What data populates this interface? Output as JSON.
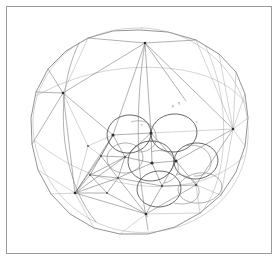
{
  "figure": {
    "caption": "",
    "background_color": "#ffffff",
    "frame": {
      "name": "figure-border",
      "x": 6,
      "y": 6,
      "width": 266,
      "height": 248,
      "stroke_color": "#9a9a9a",
      "stroke_width": 1
    },
    "colors": {
      "frame": "#9a9a9a",
      "sphere_outline": "#6f6f6f",
      "mesh_edge": "#7d7d7d",
      "mesh_edge_faint": "#a8a8a8",
      "circle_stroke": "#4a4a4a",
      "node": "#2e2e2e",
      "annotation": "#707070"
    },
    "sphere": {
      "name": "sphere-outline",
      "center_x": 140,
      "center_y": 130,
      "radius_x": 108,
      "radius_y": 100,
      "outline_points": [
        [
          140,
          30
        ],
        [
          168,
          32
        ],
        [
          196,
          40
        ],
        [
          219,
          54
        ],
        [
          236,
          72
        ],
        [
          245,
          94
        ],
        [
          248,
          118
        ],
        [
          245,
          146
        ],
        [
          236,
          172
        ],
        [
          221,
          195
        ],
        [
          200,
          213
        ],
        [
          175,
          227
        ],
        [
          148,
          234
        ],
        [
          120,
          234
        ],
        [
          94,
          228
        ],
        [
          70,
          214
        ],
        [
          51,
          194
        ],
        [
          38,
          170
        ],
        [
          32,
          144
        ],
        [
          31,
          118
        ],
        [
          36,
          92
        ],
        [
          48,
          69
        ],
        [
          66,
          51
        ],
        [
          88,
          38
        ],
        [
          113,
          31
        ]
      ]
    },
    "vertices": [
      {
        "id": "v-top",
        "x": 145,
        "y": 43
      },
      {
        "id": "v-left-upper",
        "x": 63,
        "y": 93
      },
      {
        "id": "v-right-mid",
        "x": 233,
        "y": 129
      },
      {
        "id": "v-left-lower",
        "x": 75,
        "y": 193
      },
      {
        "id": "v-bottom",
        "x": 146,
        "y": 214
      },
      {
        "id": "v-c1",
        "x": 113,
        "y": 135
      },
      {
        "id": "v-c2",
        "x": 151,
        "y": 133
      },
      {
        "id": "v-c3",
        "x": 152,
        "y": 163
      },
      {
        "id": "v-c4",
        "x": 176,
        "y": 161
      },
      {
        "id": "v-c5",
        "x": 125,
        "y": 157
      },
      {
        "id": "v-c6",
        "x": 162,
        "y": 186
      },
      {
        "id": "v-c7",
        "x": 196,
        "y": 185
      }
    ],
    "circles": [
      {
        "id": "cap-1",
        "cx": 129,
        "cy": 134,
        "rx": 22,
        "ry": 19,
        "rotate": -8
      },
      {
        "id": "cap-2",
        "cx": 174,
        "cy": 133,
        "rx": 23,
        "ry": 19,
        "rotate": -6
      },
      {
        "id": "cap-3",
        "cx": 151,
        "cy": 161,
        "rx": 23,
        "ry": 20,
        "rotate": -4
      },
      {
        "id": "cap-4",
        "cx": 196,
        "cy": 161,
        "rx": 22,
        "ry": 18,
        "rotate": -5
      },
      {
        "id": "cap-5",
        "cx": 159,
        "cy": 189,
        "rx": 22,
        "ry": 18,
        "rotate": -4
      },
      {
        "id": "cap-6",
        "cx": 200,
        "cy": 188,
        "rx": 22,
        "ry": 15,
        "rotate": -8
      },
      {
        "id": "cap-7",
        "cx": 125,
        "cy": 158,
        "rx": 18,
        "ry": 15,
        "rotate": -6
      }
    ],
    "annotations": [
      {
        "id": "label-a",
        "text": "p",
        "x": 172,
        "y": 107
      },
      {
        "id": "label-b",
        "text": "q",
        "x": 178,
        "y": 104
      },
      {
        "id": "label-c",
        "text": "c",
        "x": 141,
        "y": 126
      },
      {
        "id": "label-d",
        "text": "r",
        "x": 155,
        "y": 124
      },
      {
        "id": "label-e",
        "text": "s",
        "x": 196,
        "y": 123
      },
      {
        "id": "label-f",
        "text": "t",
        "x": 99,
        "y": 160
      },
      {
        "id": "label-g",
        "text": "u",
        "x": 146,
        "y": 217
      }
    ]
  }
}
